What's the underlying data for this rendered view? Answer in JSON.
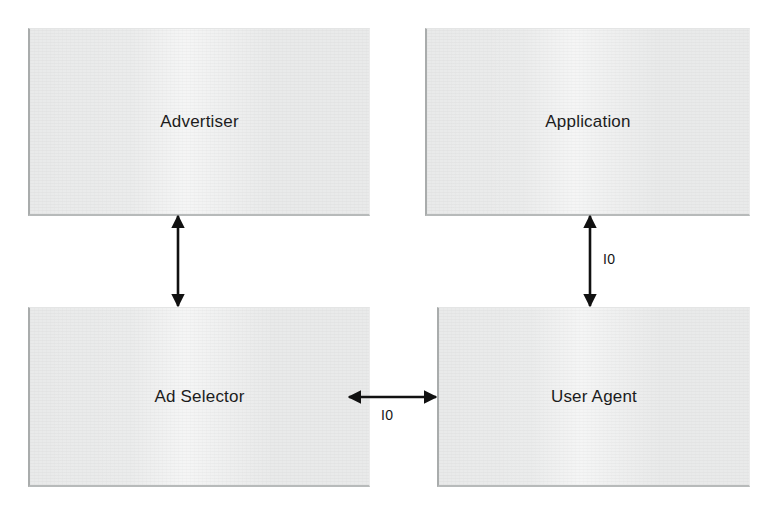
{
  "diagram": {
    "type": "block-diagram",
    "background_color": "#ffffff",
    "node_fill_color": "#e9eaea",
    "node_border_color": "#a9acac",
    "text_color": "#1c1c1c",
    "nodes": [
      {
        "id": "advertiser",
        "label": "Advertiser",
        "x": 28,
        "y": 28,
        "width": 342,
        "height": 188
      },
      {
        "id": "application",
        "label": "Application",
        "x": 425,
        "y": 28,
        "width": 325,
        "height": 188
      },
      {
        "id": "ad_selector",
        "label": "Ad Selector",
        "x": 28,
        "y": 307,
        "width": 342,
        "height": 180
      },
      {
        "id": "user_agent",
        "label": "User Agent",
        "x": 437,
        "y": 307,
        "width": 313,
        "height": 180
      }
    ],
    "edges": [
      {
        "id": "advertiser-ad-selector",
        "from": "advertiser",
        "to": "ad_selector",
        "orientation": "vertical",
        "arrowheads": "both",
        "label": ""
      },
      {
        "id": "application-user-agent",
        "from": "application",
        "to": "user_agent",
        "orientation": "vertical",
        "arrowheads": "both",
        "label": "I0"
      },
      {
        "id": "ad-selector-user-agent",
        "from": "ad_selector",
        "to": "user_agent",
        "orientation": "horizontal",
        "arrowheads": "both",
        "label": "I0"
      }
    ]
  }
}
